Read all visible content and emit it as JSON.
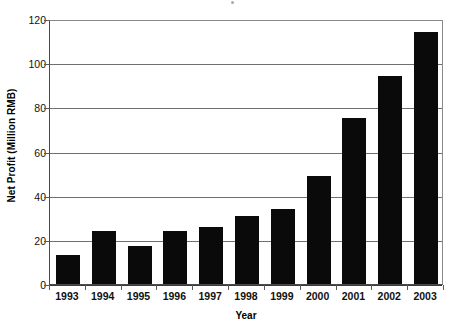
{
  "chart_data": {
    "type": "bar",
    "title": "",
    "xlabel": "Year",
    "ylabel": "Net Profit (Million RMB)",
    "categories": [
      "1993",
      "1994",
      "1995",
      "1996",
      "1997",
      "1998",
      "1999",
      "2000",
      "2001",
      "2002",
      "2003"
    ],
    "values": [
      13,
      24,
      17,
      24,
      26,
      31,
      34,
      49,
      75,
      94,
      114
    ],
    "series": [
      {
        "name": "Net Profit",
        "values": [
          13,
          24,
          17,
          24,
          26,
          31,
          34,
          49,
          75,
          94,
          114
        ]
      }
    ],
    "ylim": [
      0,
      120
    ],
    "ytick_labels": [
      "0",
      "20",
      "40",
      "60",
      "80",
      "100",
      "120"
    ],
    "ytick_values": [
      0,
      20,
      40,
      60,
      80,
      100,
      120
    ],
    "grid": true,
    "grid_axis": "y",
    "legend": false,
    "legend_position": "none",
    "bar_color": "#0a0a0a",
    "axis_color": "#4a4a4a",
    "gridline_color": "#6f6f6f",
    "background_color": "#ffffff"
  },
  "axes": {
    "y_title": "Net Profit (Million RMB)",
    "x_title": "Year"
  }
}
